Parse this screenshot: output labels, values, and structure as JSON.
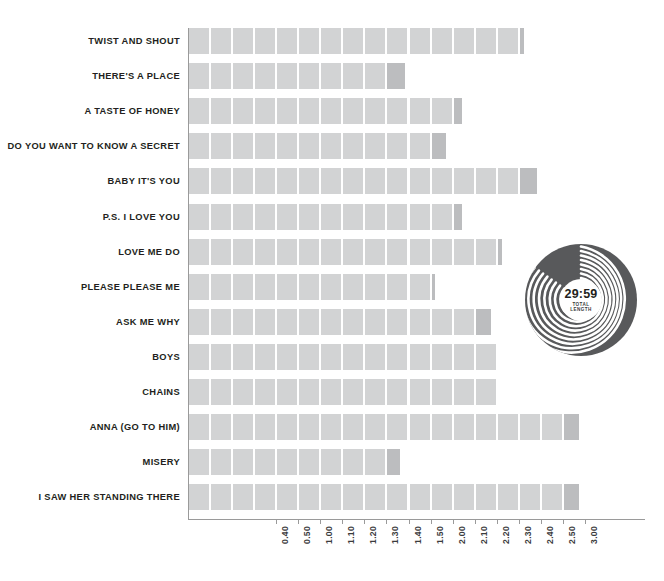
{
  "chart_data": {
    "type": "bar",
    "orientation": "horizontal",
    "title": "",
    "xlabel": "",
    "ylabel": "",
    "value_format": "m.ss",
    "unit_seconds": 10,
    "x_axis": {
      "min": 0,
      "max": 190,
      "tick_labels": [
        "0.40",
        "0.50",
        "1.00",
        "1.10",
        "1.20",
        "1.30",
        "1.40",
        "1.50",
        "2.00",
        "2.10",
        "2.20",
        "2.30",
        "2.40",
        "2.50",
        "3.00"
      ],
      "tick_seconds": [
        40,
        50,
        60,
        70,
        80,
        90,
        100,
        110,
        120,
        130,
        140,
        150,
        160,
        170,
        180
      ],
      "grid": false
    },
    "categories": [
      "TWIST AND SHOUT",
      "THERE'S A PLACE",
      "A TASTE OF HONEY",
      "DO YOU WANT TO KNOW A SECRET",
      "BABY IT'S YOU",
      "P.S. I LOVE YOU",
      "LOVE ME DO",
      "PLEASE PLEASE ME",
      "ASK ME WHY",
      "BOYS",
      "CHAINS",
      "ANNA (GO TO HIM)",
      "MISERY",
      "I SAW HER STANDING THERE"
    ],
    "values_seconds": [
      152,
      98,
      124,
      117,
      158,
      124,
      142,
      112,
      137,
      140,
      140,
      177,
      96,
      177
    ],
    "values_label": [
      "2.32",
      "1.38",
      "2.04",
      "1.57",
      "2.38",
      "2.04",
      "2.22",
      "1.52",
      "2.17",
      "2.20",
      "2.20",
      "2.57",
      "1.36",
      "2.57"
    ],
    "legend": {
      "position": "none",
      "entries": []
    }
  },
  "vinyl": {
    "total_length": "29:59",
    "caption_line1": "TOTAL",
    "caption_line2": "LENGTH"
  },
  "colors": {
    "bar": "#d2d3d4",
    "bar_partial": "#bcbdbf",
    "axis": "#9a9a9a",
    "label_text": "#231f20",
    "tick_text": "#3b3b3d",
    "vinyl_disc": "#58595b",
    "vinyl_groove": "#ffffff",
    "vinyl_label": "#ffffff",
    "background": "#ffffff"
  }
}
